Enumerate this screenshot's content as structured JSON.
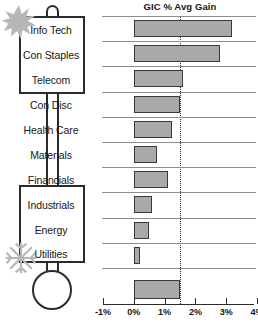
{
  "thermometer": {
    "hot_icon": "sunburst-icon",
    "cold_icon": "snowflake-icon",
    "hot_group": [
      "Info Tech",
      "Con Staples",
      "Telecom"
    ],
    "mid_group": [
      "Con Disc",
      "Health Care",
      "Materials",
      "Financials"
    ],
    "cold_group": [
      "Industrials",
      "Energy",
      "Utilities"
    ]
  },
  "chart_data": {
    "type": "bar",
    "orientation": "horizontal",
    "title": "GIC % Avg Gain",
    "xlabel": "",
    "ylabel": "",
    "categories": [
      "Info Tech",
      "Con Staples",
      "Telecom",
      "Con Disc",
      "Health Care",
      "Materials",
      "Financials",
      "Industrials",
      "Energy",
      "Utilities",
      ""
    ],
    "values": [
      3.2,
      2.8,
      1.6,
      1.5,
      1.25,
      0.75,
      1.1,
      0.6,
      0.5,
      0.2,
      1.5
    ],
    "summary_bar": {
      "label": "",
      "value": 1.5
    },
    "xlim": [
      -1,
      4
    ],
    "xticks": [
      -1,
      0,
      1,
      2,
      3,
      4
    ],
    "xticklabels": [
      "-1%",
      "0%",
      "1%",
      "2%",
      "3%",
      "4%"
    ],
    "reference_line": 1.5,
    "grid": true,
    "legend": "none",
    "bar_fill": "#a9a9a9",
    "bar_border": "#3a3a3a",
    "reference_color": "#2b2b2b"
  }
}
